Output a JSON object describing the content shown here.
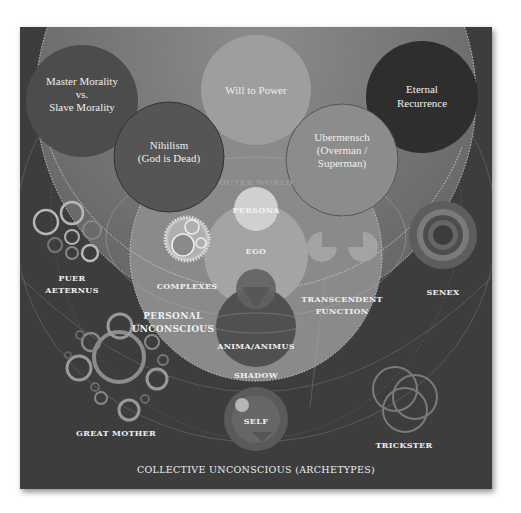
{
  "diagram": {
    "colors": {
      "background": "#3d3d3d",
      "outer_world_band": "#7a7a7a",
      "personal_unconscious": "#8a8a8a",
      "ego": "#a6a6a6",
      "persona": "#d0d0d0",
      "shadow": "#505050",
      "text": "#eeeeee"
    },
    "nietzsche_concepts": [
      {
        "id": "master-slave",
        "lines": [
          "Master Morality",
          "vs.",
          "Slave Morality"
        ]
      },
      {
        "id": "will-to-power",
        "lines": [
          "Will to Power"
        ]
      },
      {
        "id": "eternal-recurrence",
        "lines": [
          "Eternal",
          "Recurrence"
        ]
      },
      {
        "id": "nihilism",
        "lines": [
          "Nihilism",
          "(God is Dead)"
        ]
      },
      {
        "id": "ubermensch",
        "lines": [
          "Ubermensch",
          "(Overman /",
          "Superman)"
        ]
      }
    ],
    "layers": {
      "outer_world": "OUTER WORLD",
      "personal_unconscious": [
        "PERSONAL",
        "UNCONSCIOUS"
      ],
      "collective_unconscious": "COLLECTIVE UNCONSCIOUS (ARCHETYPES)"
    },
    "psyche_parts": {
      "persona": "PERSONA",
      "ego": "EGO",
      "complexes": "COMPLEXES",
      "transcendent_function": [
        "TRANSCENDENT",
        "FUNCTION"
      ],
      "anima_animus": "ANIMA/ANIMUS",
      "shadow": "SHADOW"
    },
    "archetypes": {
      "puer_aeternus": [
        "PUER",
        "AETERNUS"
      ],
      "senex": "SENEX",
      "great_mother": "GREAT MOTHER",
      "self": "SELF",
      "trickster": "TRICKSTER"
    }
  }
}
